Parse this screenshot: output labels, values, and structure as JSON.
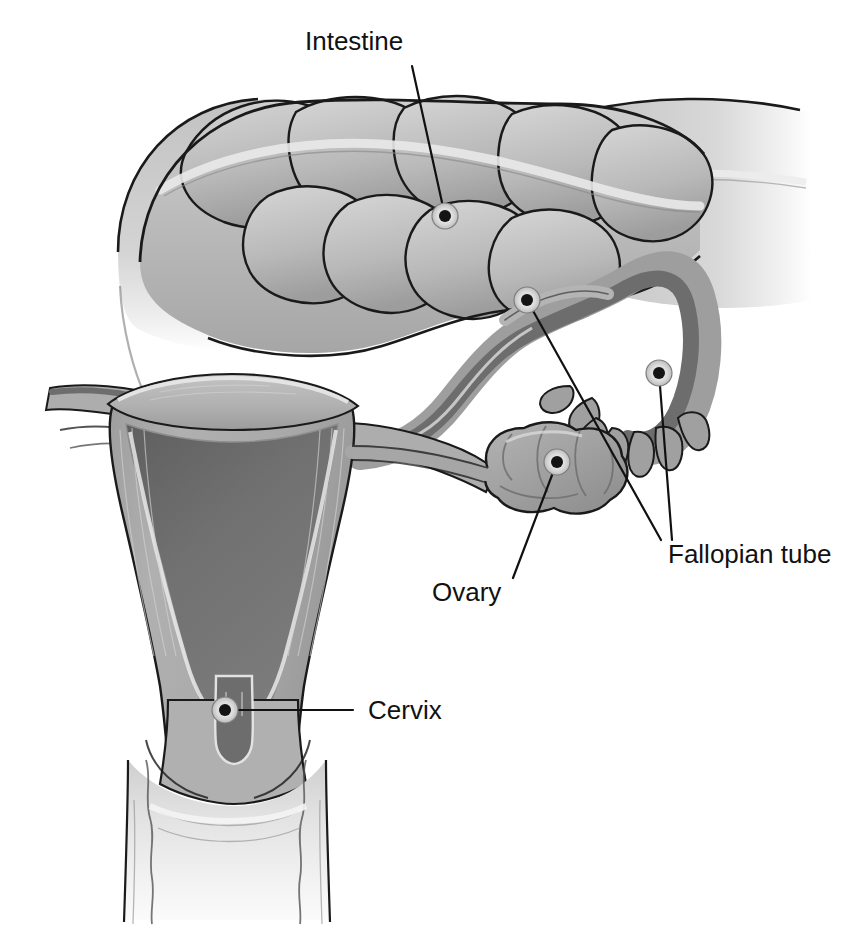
{
  "figure": {
    "background_color": "#ffffff",
    "width": 854,
    "height": 927
  },
  "palette": {
    "outline": "#1a1a1a",
    "label_text": "#111111",
    "leader_line": "#111111",
    "marker_dot": "#141414",
    "marker_halo": "#dedede",
    "intestine_light": "#d8d8d8",
    "intestine_mid": "#b4b4b4",
    "intestine_shadow": "#9a9a9a",
    "myometrium": "#a8a8a8",
    "endometrium": "#6d6d6d",
    "serosa_highlight": "#e6e6e6",
    "tube_outer": "#a9a9a9",
    "tube_lumen": "#6f6f6f",
    "ovary_fill": "#a2a2a2",
    "ovary_shade": "#8f8f8f",
    "vagina_light": "#e3e3e3",
    "vagina_wall": "#bdbdbd"
  },
  "labels": [
    {
      "id": "intestine",
      "text": "Intestine",
      "text_x": 305,
      "text_y": 50,
      "anchor": "start",
      "markers": [
        {
          "x": 445,
          "y": 216
        }
      ],
      "leaders": [
        {
          "x1": 412,
          "y1": 66,
          "x2": 445,
          "y2": 216
        }
      ]
    },
    {
      "id": "fallopian-tube",
      "text": "Fallopian tube",
      "text_x": 668,
      "text_y": 563,
      "anchor": "start",
      "markers": [
        {
          "x": 527,
          "y": 300
        },
        {
          "x": 659,
          "y": 373
        }
      ],
      "leaders": [
        {
          "x1": 661,
          "y1": 540,
          "x2": 527,
          "y2": 300
        },
        {
          "x1": 672,
          "y1": 540,
          "x2": 659,
          "y2": 373
        }
      ]
    },
    {
      "id": "ovary",
      "text": "Ovary",
      "text_x": 432,
      "text_y": 601,
      "anchor": "start",
      "markers": [
        {
          "x": 557,
          "y": 462
        }
      ],
      "leaders": [
        {
          "x1": 513,
          "y1": 578,
          "x2": 557,
          "y2": 462
        }
      ]
    },
    {
      "id": "cervix",
      "text": "Cervix",
      "text_x": 368,
      "text_y": 719,
      "anchor": "start",
      "markers": [
        {
          "x": 225,
          "y": 710
        }
      ],
      "leaders": [
        {
          "x1": 353,
          "y1": 710,
          "x2": 225,
          "y2": 710
        }
      ]
    }
  ],
  "structures": [
    {
      "id": "intestine",
      "name": "Intestine (large bowel with haustra)"
    },
    {
      "id": "uterus",
      "name": "Uterus (myometrium and endometrial cavity)"
    },
    {
      "id": "fallopian-tube-left",
      "name": "Left fallopian tube"
    },
    {
      "id": "fallopian-tube-right",
      "name": "Right fallopian tube with fimbriae"
    },
    {
      "id": "ovary",
      "name": "Ovary"
    },
    {
      "id": "cervix",
      "name": "Cervix with external os"
    },
    {
      "id": "vagina",
      "name": "Vaginal canal with rugae"
    }
  ]
}
